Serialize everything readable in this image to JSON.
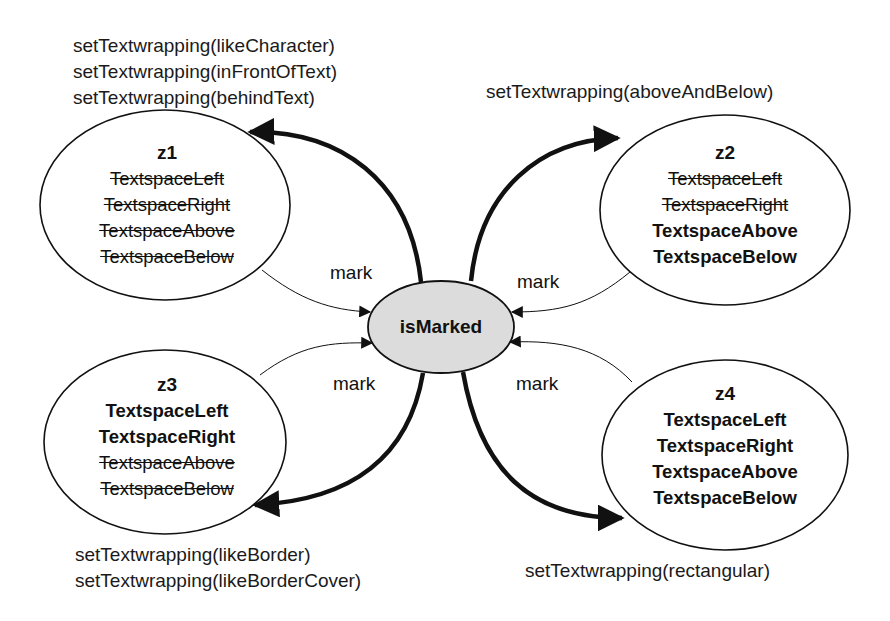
{
  "center": {
    "label": "isMarked",
    "fill": "#dcdcdc"
  },
  "states": [
    {
      "id": "z1",
      "properties": [
        {
          "name": "TextspaceLeft",
          "active": false
        },
        {
          "name": "TextspaceRight",
          "active": false
        },
        {
          "name": "TextspaceAbove",
          "active": false
        },
        {
          "name": "TextspaceBelow",
          "active": false
        }
      ],
      "actions": [
        "setTextwrapping(likeCharacter)",
        "setTextwrapping(inFrontOfText)",
        "setTextwrapping(behindText)"
      ]
    },
    {
      "id": "z2",
      "properties": [
        {
          "name": "TextspaceLeft",
          "active": false
        },
        {
          "name": "TextspaceRight",
          "active": false
        },
        {
          "name": "TextspaceAbove",
          "active": true
        },
        {
          "name": "TextspaceBelow",
          "active": true
        }
      ],
      "actions": [
        "setTextwrapping(aboveAndBelow)"
      ]
    },
    {
      "id": "z3",
      "properties": [
        {
          "name": "TextspaceLeft",
          "active": true
        },
        {
          "name": "TextspaceRight",
          "active": true
        },
        {
          "name": "TextspaceAbove",
          "active": false
        },
        {
          "name": "TextspaceBelow",
          "active": false
        }
      ],
      "actions": [
        "setTextwrapping(likeBorder)",
        "setTextwrapping(likeBorderCover)"
      ]
    },
    {
      "id": "z4",
      "properties": [
        {
          "name": "TextspaceLeft",
          "active": true
        },
        {
          "name": "TextspaceRight",
          "active": true
        },
        {
          "name": "TextspaceAbove",
          "active": true
        },
        {
          "name": "TextspaceBelow",
          "active": true
        }
      ],
      "actions": [
        "setTextwrapping(rectangular)"
      ]
    }
  ],
  "edge_label": "mark",
  "edges": [
    {
      "from": "z1",
      "to": "isMarked",
      "label": "mark"
    },
    {
      "from": "z2",
      "to": "isMarked",
      "label": "mark"
    },
    {
      "from": "z3",
      "to": "isMarked",
      "label": "mark"
    },
    {
      "from": "z4",
      "to": "isMarked",
      "label": "mark"
    },
    {
      "from": "isMarked",
      "to": "z1",
      "label": "setTextwrapping(likeCharacter|inFrontOfText|behindText)"
    },
    {
      "from": "isMarked",
      "to": "z2",
      "label": "setTextwrapping(aboveAndBelow)"
    },
    {
      "from": "isMarked",
      "to": "z3",
      "label": "setTextwrapping(likeBorder|likeBorderCover)"
    },
    {
      "from": "isMarked",
      "to": "z4",
      "label": "setTextwrapping(rectangular)"
    }
  ]
}
